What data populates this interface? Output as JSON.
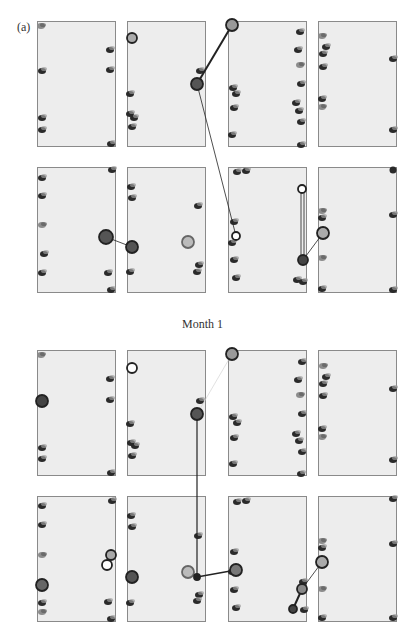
{
  "figure": {
    "panel_label": "(a)",
    "caption_between": "Month 1",
    "colors": {
      "background": "#ffffff",
      "panel_fill": "#ededed",
      "panel_border": "#8a8a8a",
      "spot": "#2a2a2a",
      "spot_light": "#8c8c8c",
      "line": "#222222"
    }
  },
  "blocks": [
    {
      "name": "top-block",
      "rows": [
        {
          "y": 21,
          "panels": [
            {
              "x": 37
            },
            {
              "x": 127
            },
            {
              "x": 228
            },
            {
              "x": 318
            }
          ]
        },
        {
          "y": 167,
          "panels": [
            {
              "x": 37
            },
            {
              "x": 127
            },
            {
              "x": 228
            },
            {
              "x": 318
            }
          ]
        }
      ]
    },
    {
      "name": "bottom-block",
      "rows": [
        {
          "y": 350,
          "panels": [
            {
              "x": 37
            },
            {
              "x": 127
            },
            {
              "x": 228
            },
            {
              "x": 318
            }
          ]
        },
        {
          "y": 496,
          "panels": [
            {
              "x": 37
            },
            {
              "x": 127
            },
            {
              "x": 228
            },
            {
              "x": 318
            }
          ]
        }
      ]
    }
  ]
}
